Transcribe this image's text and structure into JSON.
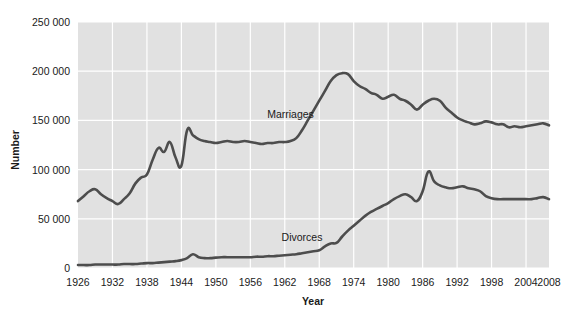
{
  "chart_data": {
    "type": "line",
    "title": "",
    "xlabel": "Year",
    "ylabel": "Number",
    "xlim": [
      1926,
      2008
    ],
    "ylim": [
      0,
      250000
    ],
    "grid": true,
    "legend_position": "inline-annotation",
    "plot_background": "#e1e1e1",
    "gridline_color": "#ffffff",
    "line_color": "#4d4d4d",
    "ytick_labels": [
      "250 000",
      "200 000",
      "150 000",
      "100 000",
      "50 000",
      "0"
    ],
    "ytick_values": [
      250000,
      200000,
      150000,
      100000,
      50000,
      0
    ],
    "xtick_labels": [
      "1926",
      "1932",
      "1938",
      "1944",
      "1950",
      "1956",
      "1962",
      "1968",
      "1974",
      "1980",
      "1986",
      "1992",
      "1998",
      "2004",
      "2008"
    ],
    "xtick_values": [
      1926,
      1932,
      1938,
      1944,
      1950,
      1956,
      1962,
      1968,
      1974,
      1980,
      1986,
      1992,
      1998,
      2004,
      2008
    ],
    "annotations": [
      {
        "text": "Marriages",
        "x": 1963,
        "y": 152000
      },
      {
        "text": "Divorces",
        "x": 1965,
        "y": 27000
      }
    ],
    "x": [
      1926,
      1927,
      1928,
      1929,
      1930,
      1931,
      1932,
      1933,
      1934,
      1935,
      1936,
      1937,
      1938,
      1939,
      1940,
      1941,
      1942,
      1943,
      1944,
      1945,
      1946,
      1947,
      1948,
      1949,
      1950,
      1951,
      1952,
      1953,
      1954,
      1955,
      1956,
      1957,
      1958,
      1959,
      1960,
      1961,
      1962,
      1963,
      1964,
      1965,
      1966,
      1967,
      1968,
      1969,
      1970,
      1971,
      1972,
      1973,
      1974,
      1975,
      1976,
      1977,
      1978,
      1979,
      1980,
      1981,
      1982,
      1983,
      1984,
      1985,
      1986,
      1987,
      1988,
      1989,
      1990,
      1991,
      1992,
      1993,
      1994,
      1995,
      1996,
      1997,
      1998,
      1999,
      2000,
      2001,
      2002,
      2003,
      2004,
      2005,
      2006,
      2007,
      2008
    ],
    "series": [
      {
        "name": "Marriages",
        "values": [
          68000,
          73000,
          78000,
          80000,
          75000,
          71000,
          68000,
          65000,
          70000,
          76000,
          86000,
          92000,
          95000,
          110000,
          122000,
          118000,
          128000,
          112000,
          104000,
          140000,
          135000,
          131000,
          129000,
          128000,
          127000,
          128000,
          129000,
          128000,
          128000,
          129000,
          128000,
          127000,
          126000,
          127000,
          127000,
          128000,
          128000,
          129000,
          132000,
          140000,
          150000,
          160000,
          170000,
          180000,
          190000,
          196000,
          198000,
          197000,
          190000,
          185000,
          182000,
          178000,
          176000,
          172000,
          174000,
          176000,
          172000,
          170000,
          166000,
          161000,
          166000,
          170000,
          172000,
          170000,
          163000,
          158000,
          153000,
          150000,
          148000,
          146000,
          147000,
          149000,
          148000,
          146000,
          146000,
          143000,
          144000,
          143000,
          144000,
          145000,
          146000,
          147000,
          145000
        ]
      },
      {
        "name": "Divorces",
        "values": [
          3000,
          3000,
          3000,
          3500,
          3500,
          3500,
          3500,
          3500,
          4000,
          4000,
          4000,
          4500,
          5000,
          5000,
          5500,
          6000,
          6500,
          7000,
          8000,
          10000,
          14000,
          11000,
          10000,
          10000,
          10500,
          11000,
          11000,
          11000,
          11000,
          11000,
          11000,
          11500,
          11500,
          12000,
          12000,
          12500,
          13000,
          13500,
          14000,
          15000,
          16000,
          17000,
          18000,
          22000,
          25000,
          25500,
          32000,
          38000,
          43000,
          48000,
          53000,
          57000,
          60000,
          63000,
          66000,
          70000,
          73000,
          75000,
          72000,
          68000,
          78000,
          98000,
          88000,
          84000,
          82000,
          81000,
          82000,
          83000,
          81000,
          80000,
          78000,
          73000,
          71000,
          70000,
          70000,
          70000,
          70000,
          70000,
          70000,
          70000,
          71000,
          72000,
          70000
        ]
      }
    ]
  }
}
